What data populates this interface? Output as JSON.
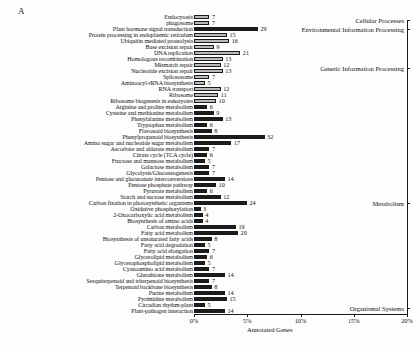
{
  "panel": {
    "letter": "A"
  },
  "axis": {
    "xlabel": "Annotated Genes",
    "ticks": [
      "0%",
      "5%",
      "10%",
      "15%",
      "20%"
    ],
    "tick_values": [
      0,
      5,
      10,
      15,
      20
    ]
  },
  "groups": [
    {
      "label": "Cellular Processes"
    },
    {
      "label": "Environmental Information Processing"
    },
    {
      "label": "Genetic Information Processing"
    },
    {
      "label": "Metabolism"
    },
    {
      "label": "Organismal Systems"
    }
  ],
  "chart_data": {
    "type": "bar",
    "orientation": "horizontal",
    "title": "",
    "xlabel": "Annotated Genes",
    "ylabel": "",
    "xlim": [
      0,
      20
    ],
    "xticks": [
      0,
      5,
      10,
      15,
      20
    ],
    "xtick_labels": [
      "0%",
      "5%",
      "10%",
      "15%",
      "20%"
    ],
    "grid": false,
    "legend": false,
    "value_unit": "gene count",
    "categories": [
      "Endocytosis",
      "phagosome",
      "Plant hormone signal transduction",
      "Protein processing in endoplasmic reticulum",
      "Ubiquitin mediated proteolysis",
      "Base excision repair",
      "DNA replication",
      "Homologous recombination",
      "Mismatch repair",
      "Nucleotide excision repair",
      "Spliceosome",
      "Aminoacyl-tRNA biosynthesis",
      "RNA transport",
      "Ribosome",
      "Ribosome biogenesis in eukaryotes",
      "Arginine and proline metabolism",
      "Cysteine and methionine metabolism",
      "Phenylalanine metabolism",
      "Tryptophan metabolism",
      "Flavonoid biosynthesis",
      "Phenylpropanoid biosynthesis",
      "Amino sugar and nucleotide sugar metabolism",
      "Ascorbate and aldarate metabolism",
      "Citrate cycle (TCA cycle)",
      "Fructose and mannose metabolism",
      "Galactose metabolism",
      "Glycolysis/Gluconeogenesis",
      "Pentose and glucuronate interconversions",
      "Pentose phosphate pathway",
      "Pyruvate metabolism",
      "Starch and sucrose metabolism",
      "Carbon fixation in photosynthetic organisms",
      "Oxidative phosphorylation",
      "2-Oxocarboxylic acid metabolism",
      "Biosynthesis of amino acids",
      "Carbon metabolism",
      "Fatty acid metabolism",
      "Biosynthesis of unsaturated fatty acids",
      "Fatty acid degradation",
      "Fatty acid elongation",
      "Glycerolipid metabolism",
      "Glycerophospholipid metabolism",
      "Cyanoamino acid metabolism",
      "Glutathione metabolism",
      "Sesquiterpenoid and triterpenoid biosynthesis",
      "Terpenoid backbone biosynthesis",
      "Purine metabolism",
      "Pyrimidine metabolism",
      "Circadian rhythm-plant",
      "Plant-pathogen interaction"
    ],
    "values": [
      7,
      7,
      29,
      15,
      16,
      9,
      21,
      13,
      12,
      13,
      7,
      5,
      12,
      11,
      10,
      6,
      9,
      13,
      6,
      8,
      32,
      17,
      7,
      6,
      5,
      7,
      7,
      14,
      10,
      6,
      12,
      24,
      3,
      4,
      4,
      19,
      20,
      8,
      5,
      7,
      6,
      5,
      7,
      14,
      7,
      8,
      14,
      15,
      5,
      14
    ],
    "shades": [
      "light",
      "light",
      "dark",
      "light",
      "light",
      "light",
      "light",
      "light",
      "light",
      "light",
      "light",
      "light",
      "light",
      "light",
      "light",
      "dark",
      "dark",
      "dark",
      "dark",
      "dark",
      "dark",
      "dark",
      "dark",
      "dark",
      "dark",
      "dark",
      "dark",
      "dark",
      "dark",
      "dark",
      "dark",
      "dark",
      "dark",
      "dark",
      "dark",
      "dark",
      "dark",
      "dark",
      "dark",
      "dark",
      "dark",
      "dark",
      "dark",
      "dark",
      "dark",
      "dark",
      "dark",
      "dark",
      "dark",
      "dark"
    ],
    "percents": [
      1.45,
      1.45,
      6.0,
      3.1,
      3.3,
      1.86,
      4.35,
      2.7,
      2.5,
      2.7,
      1.45,
      1.04,
      2.5,
      2.28,
      2.07,
      1.24,
      1.86,
      2.7,
      1.24,
      1.66,
      6.63,
      3.52,
      1.45,
      1.24,
      1.04,
      1.45,
      1.45,
      2.9,
      2.07,
      1.24,
      2.5,
      4.97,
      0.62,
      0.83,
      0.83,
      3.94,
      4.14,
      1.66,
      1.04,
      1.45,
      1.24,
      1.04,
      1.45,
      2.9,
      1.45,
      1.66,
      2.9,
      3.1,
      1.04,
      2.9
    ],
    "group_spans": [
      {
        "label": "Cellular Processes",
        "start": 0,
        "end": 1
      },
      {
        "label": "Environmental Information Processing",
        "start": 2,
        "end": 2
      },
      {
        "label": "Genetic Information Processing",
        "start": 3,
        "end": 14
      },
      {
        "label": "Metabolism",
        "start": 15,
        "end": 47
      },
      {
        "label": "Organismal Systems",
        "start": 48,
        "end": 49
      }
    ]
  }
}
